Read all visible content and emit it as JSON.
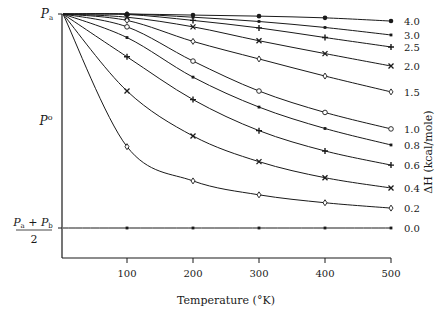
{
  "chart_data": {
    "type": "line",
    "title": "",
    "xlabel": "Temperature (°K)",
    "ylabel_right": "ΔH (kcal/mole)",
    "xlim": [
      0,
      500
    ],
    "ylim_normalized": [
      0,
      1
    ],
    "x_ticks": [
      100,
      200,
      300,
      400,
      500
    ],
    "y_tick_labels": {
      "top": "Pa",
      "middle": "P°",
      "bottom": "(Pa + Pb)/2"
    },
    "grid": false,
    "legend_position": "right (inline series labels)",
    "note": "y values expressed as fraction f=(P-(Pa+Pb)/2)/(Pa-(Pa+Pb)/2); 1 = Pa, 0 = (Pa+Pb)/2",
    "x": [
      0,
      100,
      200,
      300,
      400,
      500
    ],
    "series": [
      {
        "name": "4.0",
        "marker": "filled-circle",
        "values": [
          1.0,
          1.0,
          0.995,
          0.99,
          0.982,
          0.967
        ]
      },
      {
        "name": "3.0",
        "marker": "dot",
        "values": [
          1.0,
          1.0,
          0.985,
          0.965,
          0.937,
          0.902
        ]
      },
      {
        "name": "2.5",
        "marker": "plus",
        "values": [
          1.0,
          0.998,
          0.97,
          0.935,
          0.89,
          0.846
        ]
      },
      {
        "name": "2.0",
        "marker": "x",
        "values": [
          1.0,
          0.985,
          0.94,
          0.875,
          0.815,
          0.757
        ]
      },
      {
        "name": "1.5",
        "marker": "diamond",
        "values": [
          1.0,
          0.97,
          0.872,
          0.79,
          0.71,
          0.636
        ]
      },
      {
        "name": "1.0",
        "marker": "open-circle",
        "values": [
          1.0,
          0.94,
          0.78,
          0.64,
          0.54,
          0.463
        ]
      },
      {
        "name": "0.8",
        "marker": "dot",
        "values": [
          1.0,
          0.89,
          0.705,
          0.565,
          0.465,
          0.388
        ]
      },
      {
        "name": "0.6",
        "marker": "plus",
        "values": [
          1.0,
          0.8,
          0.6,
          0.455,
          0.36,
          0.294
        ]
      },
      {
        "name": "0.4",
        "marker": "x",
        "values": [
          1.0,
          0.64,
          0.43,
          0.31,
          0.235,
          0.187
        ]
      },
      {
        "name": "0.2",
        "marker": "diamond",
        "values": [
          1.0,
          0.38,
          0.22,
          0.155,
          0.118,
          0.093
        ]
      },
      {
        "name": "0.0",
        "marker": "dot",
        "values": [
          0.0,
          0.0,
          0.0,
          0.0,
          0.0,
          0.0
        ]
      }
    ]
  }
}
